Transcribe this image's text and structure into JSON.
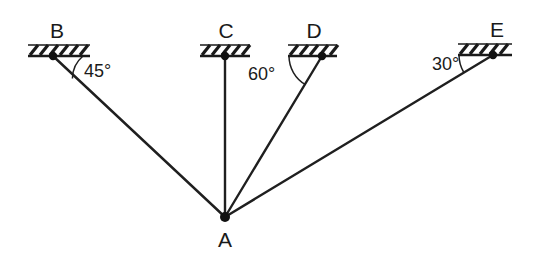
{
  "figure": {
    "background_color": "#ffffff",
    "line_color": "#1f1f1f",
    "text_color": "#1a1a1a",
    "width": 533,
    "height": 258
  },
  "joint": {
    "label": "A",
    "x": 225,
    "y": 217,
    "label_x": 225,
    "label_y": 247
  },
  "supports": [
    {
      "id": "support-b",
      "label": "B",
      "x": 53,
      "y": 56,
      "label_x": 57,
      "label_y": 38,
      "base_x1": 28,
      "base_x2": 90,
      "hatch_count": 6,
      "has_member": true
    },
    {
      "id": "support-c",
      "label": "C",
      "x": 225,
      "y": 56,
      "label_x": 226,
      "label_y": 38,
      "base_x1": 200,
      "base_x2": 250,
      "hatch_count": 5,
      "has_member": true
    },
    {
      "id": "support-d",
      "label": "D",
      "x": 322,
      "y": 56,
      "label_x": 314,
      "label_y": 38,
      "base_x1": 288,
      "base_x2": 337,
      "hatch_count": 5,
      "has_member": true
    },
    {
      "id": "support-e",
      "label": "E",
      "x": 493,
      "y": 55,
      "label_x": 497,
      "label_y": 37,
      "base_x1": 458,
      "base_x2": 512,
      "hatch_count": 5,
      "has_member": true
    }
  ],
  "members": [
    {
      "id": "member-ab",
      "from": "A",
      "to": "B",
      "x1": 225,
      "y1": 217,
      "x2": 53,
      "y2": 56
    },
    {
      "id": "member-ac",
      "from": "A",
      "to": "C",
      "x1": 225,
      "y1": 217,
      "x2": 225,
      "y2": 56
    },
    {
      "id": "member-ad",
      "from": "A",
      "to": "D",
      "x1": 225,
      "y1": 217,
      "x2": 322,
      "y2": 56
    },
    {
      "id": "member-ae",
      "from": "A",
      "to": "E",
      "x1": 225,
      "y1": 217,
      "x2": 493,
      "y2": 55
    }
  ],
  "angles": [
    {
      "id": "angle-b",
      "text": "45°",
      "value": 45,
      "unit": "degrees",
      "at_support": "B",
      "member": "member-ab",
      "label_x": 84,
      "label_y": 77,
      "arc_radius": 30
    },
    {
      "id": "angle-d",
      "text": "60°",
      "value": 60,
      "unit": "degrees",
      "at_support": "D",
      "member": "member-ad",
      "label_x": 248,
      "label_y": 80,
      "arc_radius": 33
    },
    {
      "id": "angle-e",
      "text": "30°",
      "value": 30,
      "unit": "degrees",
      "at_support": "E",
      "member": "member-ae",
      "label_x": 432,
      "label_y": 70,
      "arc_radius": 34
    }
  ]
}
